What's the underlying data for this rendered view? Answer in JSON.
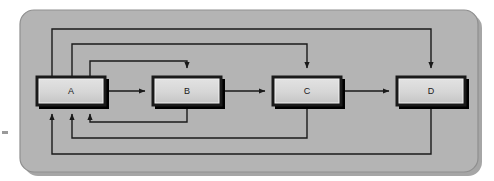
{
  "figure": {
    "kind": "block-diagram",
    "canvas": {
      "width": 494,
      "height": 181
    },
    "background_color": "#ffffff"
  },
  "panel": {
    "name": "outer-panel",
    "fill_color": "#b4b4b4",
    "border_color": "#8a8a8a",
    "shadow_color": "#9a9a9a",
    "corner_radius": 14,
    "x": 20,
    "y": 10,
    "width": 458,
    "height": 162
  },
  "nodes": [
    {
      "id": "A",
      "label": "A",
      "x": 36,
      "y": 76,
      "width": 70,
      "height": 30
    },
    {
      "id": "B",
      "label": "B",
      "x": 152,
      "y": 76,
      "width": 70,
      "height": 30
    },
    {
      "id": "C",
      "label": "C",
      "x": 272,
      "y": 76,
      "width": 70,
      "height": 30
    },
    {
      "id": "D",
      "label": "D",
      "x": 396,
      "y": 76,
      "width": 70,
      "height": 30
    }
  ],
  "node_style": {
    "face_color": "#d2d2d2",
    "inner_face_color": "#dcdcdc",
    "outline_color": "#1a1a1a",
    "shadow_color": "#000000",
    "highlight_color": "#f0f0f0",
    "label_color": "#1a1a1a"
  },
  "edge_style": {
    "line_color": "#1a1a1a",
    "line_width": 1.4,
    "arrow_head_length": 6,
    "arrow_head_width": 5
  },
  "edges": [
    {
      "id": "a-to-b",
      "from": "A",
      "to": "B",
      "kind": "forward-direct",
      "route": "horizontal"
    },
    {
      "id": "b-to-c",
      "from": "B",
      "to": "C",
      "kind": "forward-direct",
      "route": "horizontal"
    },
    {
      "id": "c-to-d",
      "from": "C",
      "to": "D",
      "kind": "forward-direct",
      "route": "horizontal"
    },
    {
      "id": "a-to-b-skip",
      "from": "A",
      "to": "B",
      "kind": "forward-skip",
      "route": "over-top",
      "level": 3
    },
    {
      "id": "a-to-c-skip",
      "from": "A",
      "to": "C",
      "kind": "forward-skip",
      "route": "over-top",
      "level": 2
    },
    {
      "id": "a-to-d-skip",
      "from": "A",
      "to": "D",
      "kind": "forward-skip",
      "route": "over-top",
      "level": 1
    },
    {
      "id": "b-to-a-feedback",
      "from": "B",
      "to": "A",
      "kind": "feedback",
      "route": "under-bottom",
      "level": 3
    },
    {
      "id": "c-to-a-feedback",
      "from": "C",
      "to": "A",
      "kind": "feedback",
      "route": "under-bottom",
      "level": 2
    },
    {
      "id": "d-to-a-feedback",
      "from": "D",
      "to": "A",
      "kind": "feedback",
      "route": "under-bottom",
      "level": 1
    }
  ],
  "margin_mark": {
    "name": "left-margin-tick",
    "x": 2,
    "y": 131,
    "width": 6,
    "height": 3,
    "color": "#9a9a9a"
  }
}
